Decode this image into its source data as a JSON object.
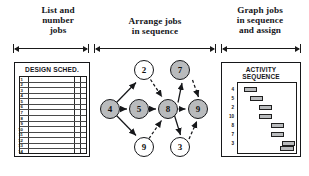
{
  "figure": {
    "stages": [
      {
        "id": "list",
        "label": "List and\nnumber\njobs"
      },
      {
        "id": "arrange",
        "label": "Arrange jobs\nin sequence"
      },
      {
        "id": "graph",
        "label": "Graph jobs\nin sequence\nand assign"
      }
    ]
  },
  "form_panel": {
    "title": "DESIGN SCHED.",
    "row_numbers": [
      "1",
      "2",
      "3",
      "4",
      "5",
      "6",
      "7",
      "8",
      "9",
      "10",
      "11",
      "12",
      "13",
      "14"
    ]
  },
  "graph_panel": {
    "nodes": [
      {
        "id": "n4",
        "label": "4",
        "x": 6,
        "y": 41,
        "d": 20,
        "shaded": true
      },
      {
        "id": "n5",
        "label": "5",
        "x": 35,
        "y": 41,
        "d": 20,
        "shaded": true
      },
      {
        "id": "n8",
        "label": "8",
        "x": 64,
        "y": 41,
        "d": 20,
        "shaded": true
      },
      {
        "id": "n9r",
        "label": "9",
        "x": 94,
        "y": 41,
        "d": 20,
        "shaded": true
      },
      {
        "id": "n2",
        "label": "2",
        "x": 40,
        "y": 2,
        "d": 20,
        "shaded": false
      },
      {
        "id": "n7",
        "label": "7",
        "x": 76,
        "y": 2,
        "d": 20,
        "shaded": true
      },
      {
        "id": "n9b",
        "label": "9",
        "x": 40,
        "y": 79,
        "d": 20,
        "shaded": false
      },
      {
        "id": "n3",
        "label": "3",
        "x": 76,
        "y": 79,
        "d": 20,
        "shaded": false
      }
    ],
    "edges": [
      {
        "from": "n4",
        "to": "n2",
        "style": "solid"
      },
      {
        "from": "n4",
        "to": "n5",
        "style": "solid"
      },
      {
        "from": "n4",
        "to": "n9b",
        "style": "solid"
      },
      {
        "from": "n5",
        "to": "n8",
        "style": "solid"
      },
      {
        "from": "n2",
        "to": "n8",
        "style": "dashed"
      },
      {
        "from": "n9b",
        "to": "n8",
        "style": "dashed"
      },
      {
        "from": "n8",
        "to": "n7",
        "style": "solid"
      },
      {
        "from": "n8",
        "to": "n9r",
        "style": "solid"
      },
      {
        "from": "n8",
        "to": "n3",
        "style": "solid"
      },
      {
        "from": "n7",
        "to": "n9r",
        "style": "dashed"
      },
      {
        "from": "n3",
        "to": "n9r",
        "style": "dashed"
      }
    ]
  },
  "activity_panel": {
    "title": "ACTIVITY\nSEQUENCE",
    "rows": [
      {
        "label": "4",
        "bar_start": 6,
        "bar_width": 13
      },
      {
        "label": "5",
        "bar_start": 12,
        "bar_width": 13
      },
      {
        "label": "2",
        "bar_start": 21,
        "bar_width": 13
      },
      {
        "label": "10",
        "bar_start": 21,
        "bar_width": 13
      },
      {
        "label": "8",
        "bar_start": 33,
        "bar_width": 13
      },
      {
        "label": "7",
        "bar_start": 33,
        "bar_width": 13
      },
      {
        "label": "3",
        "bar_start": 44,
        "bar_width": 13
      }
    ]
  },
  "colors": {
    "ink": "#16171a",
    "shade": "#b9bbbd",
    "paper": "#ffffff"
  }
}
